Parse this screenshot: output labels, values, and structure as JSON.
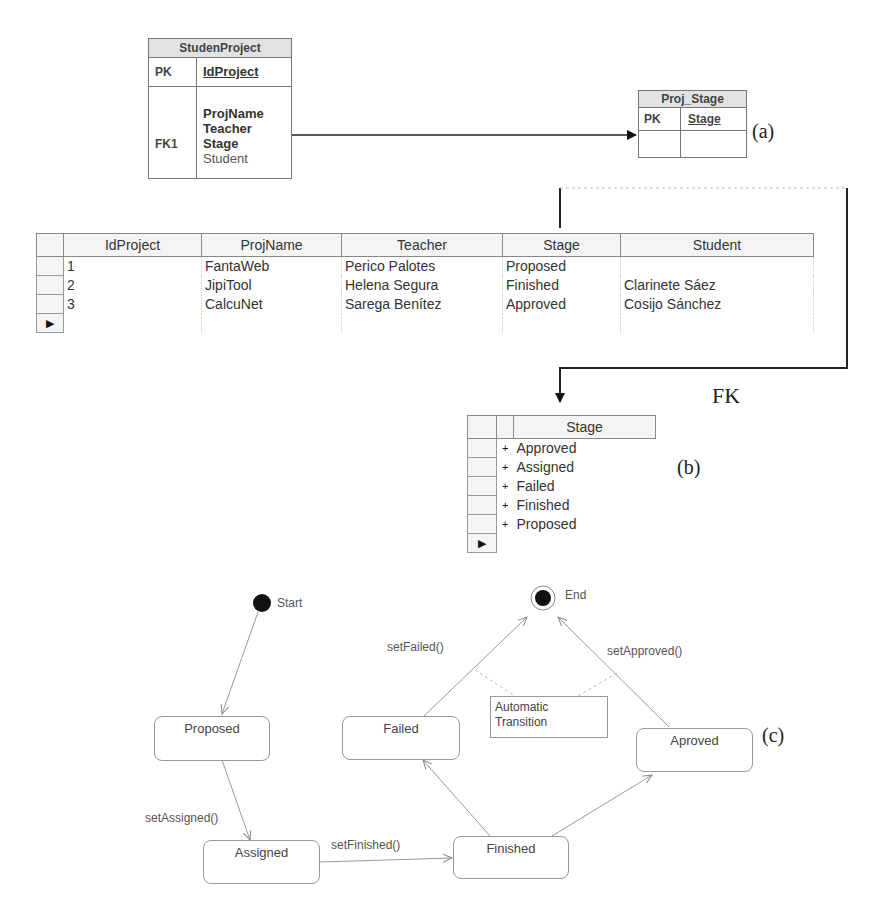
{
  "er_diagram": {
    "panel_label": "(a)",
    "student_project": {
      "title": "StudenProject",
      "pk_label": "PK",
      "pk_field": "IdProject",
      "fk_label": "FK1",
      "fields": [
        "ProjName",
        "Teacher",
        "Stage",
        "Student"
      ]
    },
    "proj_stage": {
      "title": "Proj_Stage",
      "pk_label": "PK",
      "pk_field": "Stage"
    }
  },
  "project_table": {
    "columns": [
      "IdProject",
      "ProjName",
      "Teacher",
      "Stage",
      "Student"
    ],
    "rows": [
      [
        "1",
        "FantaWeb",
        "Perico Palotes",
        "Proposed",
        ""
      ],
      [
        "2",
        "JipiTool",
        "Helena Segura",
        "Finished",
        "Clarinete Sáez"
      ],
      [
        "3",
        "CalcuNet",
        "Sarega Benítez",
        "Approved",
        "Cosijo Sánchez"
      ]
    ],
    "new_row_marker": "▶"
  },
  "fk_label": "FK",
  "stage_table": {
    "panel_label": "(b)",
    "column": "Stage",
    "expander": "+",
    "rows": [
      "Approved",
      "Assigned",
      "Failed",
      "Finished",
      "Proposed"
    ],
    "new_row_marker": "▶"
  },
  "state_diagram": {
    "panel_label": "(c)",
    "start_label": "Start",
    "end_label": "End",
    "states": {
      "proposed": "Proposed",
      "assigned": "Assigned",
      "finished": "Finished",
      "failed": "Failed",
      "approved": "Aproved"
    },
    "transitions": {
      "set_assigned": "setAssigned()",
      "set_finished": "setFinished()",
      "set_failed": "setFailed()",
      "set_approved": "setApproved()"
    },
    "note": {
      "line1": "Automatic",
      "line2": "Transition"
    }
  }
}
